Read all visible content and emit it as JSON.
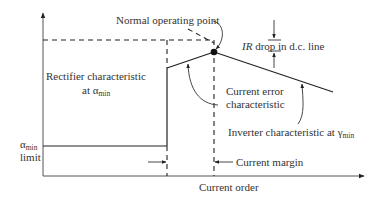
{
  "diagram": {
    "labels": {
      "normal_operating_point": "Normal operating point",
      "ir_drop": {
        "italic": "IR",
        "rest": " drop in d.c. line"
      },
      "rectifier": {
        "line1": "Rectifier characteristic",
        "line2_prefix": "at ",
        "symbol": "α",
        "subscript": "min"
      },
      "current_error": {
        "line1": "Current error",
        "line2": "characteristic"
      },
      "inverter": {
        "prefix": "Inverter characteristic at ",
        "symbol": "γ",
        "subscript": "min"
      },
      "alpha_min_limit": {
        "symbol": "α",
        "subscript": "min",
        "line2": "limit"
      },
      "current_margin": "Current margin",
      "x_axis": "Current order"
    },
    "colors": {
      "line": "#222222",
      "text": "#333333",
      "axis": "#555555",
      "background": "#ffffff"
    }
  }
}
